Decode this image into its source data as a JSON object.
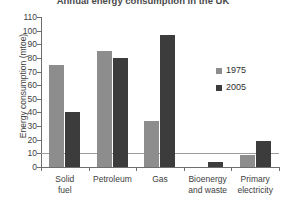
{
  "chart_data": {
    "type": "bar",
    "title": "Annual energy consumption in the UK",
    "xlabel": "",
    "ylabel": "Energy consumption (mtoe)",
    "ylim": [
      0,
      110
    ],
    "ytick_step": 10,
    "yticks": [
      "110",
      "100",
      "90",
      "80",
      "70",
      "60",
      "50",
      "40",
      "30",
      "20",
      "10",
      "0"
    ],
    "grid": "horizontal gridline at y = 10 only",
    "legend_position": "right, inside plot area",
    "categories": [
      "Solid fuel",
      "Petroleum",
      "Gas",
      "Bioenergy and waste",
      "Primary electricity"
    ],
    "category_lines": [
      [
        "Solid",
        "fuel"
      ],
      [
        "Petroleum",
        ""
      ],
      [
        "Gas",
        ""
      ],
      [
        "Bioenergy",
        "and waste"
      ],
      [
        "Primary",
        "electricity"
      ]
    ],
    "series": [
      {
        "name": "1975",
        "color": "#8d8d8d",
        "values": [
          75,
          85,
          34,
          0,
          9
        ]
      },
      {
        "name": "2005",
        "color": "#3c3c3c",
        "values": [
          40,
          80,
          97,
          4,
          19
        ]
      }
    ]
  },
  "legend": {
    "items": [
      {
        "label": "1975",
        "color": "#8d8d8d"
      },
      {
        "label": "2005",
        "color": "#3c3c3c"
      }
    ]
  }
}
